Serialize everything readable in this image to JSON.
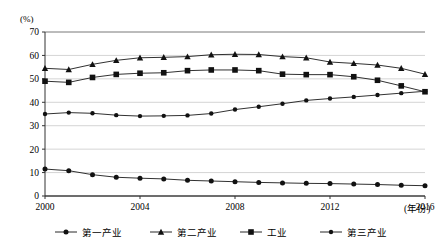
{
  "chart_data": {
    "type": "line",
    "title": "",
    "xlabel": "年份",
    "ylabel": "(%)",
    "ylim": [
      0,
      70
    ],
    "xlim": [
      2000,
      2016
    ],
    "grid": true,
    "legend_position": "bottom",
    "y_ticks": [
      "0",
      "10",
      "20",
      "30",
      "40",
      "50",
      "60",
      "70"
    ],
    "y_tick_values": [
      0,
      10,
      20,
      30,
      40,
      50,
      60,
      70
    ],
    "x_ticks": [
      "2000",
      "2004",
      "2008",
      "2012",
      "2016"
    ],
    "x_tick_values": [
      2000,
      2004,
      2008,
      2012,
      2016
    ],
    "x": [
      2000,
      2001,
      2002,
      2003,
      2004,
      2005,
      2006,
      2007,
      2008,
      2009,
      2010,
      2011,
      2012,
      2013,
      2014,
      2015,
      2016
    ],
    "series": [
      {
        "name": "第一产业",
        "marker": "circle",
        "color": "#1a1a1a",
        "values": [
          11.5,
          10.8,
          9.1,
          8.0,
          7.6,
          7.3,
          6.7,
          6.4,
          6.1,
          5.8,
          5.6,
          5.4,
          5.3,
          5.1,
          4.9,
          4.6,
          4.4
        ]
      },
      {
        "name": "第二产业",
        "marker": "triangle",
        "color": "#1a1a1a",
        "values": [
          54.5,
          54.0,
          56.2,
          57.9,
          59.0,
          59.2,
          59.5,
          60.3,
          60.5,
          60.4,
          59.5,
          59.0,
          57.2,
          56.6,
          55.9,
          54.5,
          52.0
        ]
      },
      {
        "name": "工业",
        "marker": "square",
        "color": "#1a1a1a",
        "values": [
          49.0,
          48.5,
          50.6,
          51.9,
          52.4,
          52.6,
          53.5,
          53.8,
          53.8,
          53.5,
          52.0,
          51.8,
          51.8,
          50.9,
          49.4,
          47.0,
          44.5
        ]
      },
      {
        "name": "第三产业",
        "marker": "dot",
        "color": "#1a1a1a",
        "values": [
          35.0,
          35.6,
          35.3,
          34.5,
          34.1,
          34.2,
          34.4,
          35.2,
          36.9,
          38.1,
          39.4,
          40.8,
          41.6,
          42.3,
          43.1,
          43.9,
          44.7
        ]
      }
    ]
  },
  "legend": {
    "items": [
      {
        "label": "第一产业",
        "marker": "circle"
      },
      {
        "label": "第二产业",
        "marker": "triangle"
      },
      {
        "label": "工业",
        "marker": "square"
      },
      {
        "label": "第三产业",
        "marker": "dot"
      }
    ]
  }
}
